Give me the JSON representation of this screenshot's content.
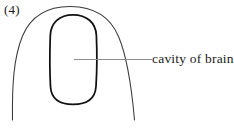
{
  "figure": {
    "number_label": "(4)",
    "caption_text": "",
    "background_color": "#ffffff",
    "outline_color": "#3a3a3a",
    "cavity_outline_color": "#111111",
    "leader_line_color": "#8c8c8c",
    "text_color": "#1b1b1b",
    "width": 234,
    "height": 128
  },
  "annotations": [
    {
      "id": "cavity-of-brain",
      "label": "cavity of brain",
      "leader_from_x": 74,
      "leader_to_x": 152,
      "leader_y": 59
    }
  ],
  "shapes": {
    "brain_outer_outline_name": "brain-outer-outline",
    "brain_cavity_name": "brain-cavity-outline"
  }
}
